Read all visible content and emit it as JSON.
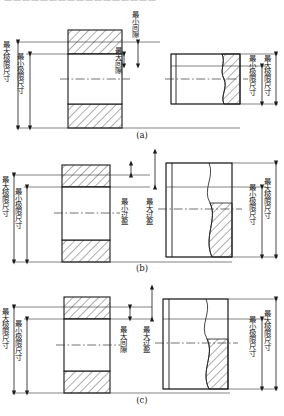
{
  "figure": {
    "title_cutoff_strip": "一一一一一一一一一一一一一一一一一",
    "line_color": "#1a1a1a",
    "hatch_color": "#4a4a4a",
    "center_line_color": "#333333"
  },
  "labels": {
    "max_limit_size": "最大极限尺寸",
    "min_limit_size": "最小极限尺寸",
    "min_clearance": "最小间隙",
    "max_clearance": "最大间隙",
    "min_interference": "最小过盈",
    "max_interference": "最大过盈"
  },
  "panels": [
    {
      "id": "a",
      "caption": "(a)",
      "fit_type": "clearance",
      "hole_labels": [
        "最大极限尺寸",
        "最小极限尺寸"
      ],
      "gap_labels": [
        "最小间隙",
        "最大间隙"
      ],
      "shaft_labels": [
        "最小极限尺寸",
        "最大极限尺寸"
      ]
    },
    {
      "id": "b",
      "caption": "(b)",
      "fit_type": "interference",
      "hole_labels": [
        "最大极限尺寸",
        "最小极限尺寸"
      ],
      "gap_labels": [
        "最小过盈",
        "最大过盈"
      ],
      "shaft_labels": [
        "最小极限尺寸",
        "最大极限尺寸"
      ]
    },
    {
      "id": "c",
      "caption": "(c)",
      "fit_type": "transition",
      "hole_labels": [
        "最大极限尺寸",
        "最小极限尺寸"
      ],
      "gap_labels": [
        "最大间隙",
        "最大过盈"
      ],
      "shaft_labels": [
        "最小极限尺寸",
        "最大极限尺寸"
      ]
    }
  ]
}
